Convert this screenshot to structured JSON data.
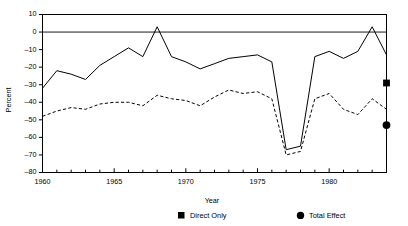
{
  "chart_data": {
    "type": "line",
    "title": "",
    "xlabel": "Year",
    "ylabel": "Percent",
    "xlim": [
      1960,
      1984
    ],
    "ylim": [
      -80,
      10
    ],
    "grid": false,
    "legend_position": "bottom",
    "y_ticks": [
      10,
      0,
      -10,
      -20,
      -30,
      -40,
      -50,
      -60,
      -70,
      -80
    ],
    "y_tick_labels": [
      "10",
      "0",
      "-10",
      "-20",
      "-30",
      "-40",
      "-50",
      "-60",
      "-70",
      "-80"
    ],
    "x_ticks": [
      1960,
      1961,
      1962,
      1963,
      1964,
      1965,
      1966,
      1967,
      1968,
      1969,
      1970,
      1971,
      1972,
      1973,
      1974,
      1975,
      1976,
      1977,
      1978,
      1979,
      1980,
      1981,
      1982,
      1983,
      1984
    ],
    "x_tick_labels_shown": [
      "1960",
      "1965",
      "1970",
      "1975",
      "1980"
    ],
    "x_labeled_ticks": [
      1960,
      1965,
      1970,
      1975,
      1980
    ],
    "reference_line_y": 0,
    "x": [
      1960,
      1961,
      1962,
      1963,
      1964,
      1965,
      1966,
      1967,
      1968,
      1969,
      1970,
      1971,
      1972,
      1973,
      1974,
      1975,
      1976,
      1977,
      1978,
      1979,
      1980,
      1981,
      1982,
      1983,
      1984
    ],
    "series": [
      {
        "name": "Direct Only",
        "style": "solid",
        "marker": "square",
        "values": [
          -32,
          -22,
          -24,
          -27,
          -19,
          -14,
          -9,
          -14,
          3,
          -14,
          -17,
          -21,
          -18,
          -15,
          -14,
          -13,
          -17,
          -22,
          -29,
          -40,
          -57,
          -65,
          -67,
          -63,
          -52
        ]
      },
      {
        "name": "Total Effect",
        "style": "dashed",
        "marker": "circle",
        "values": [
          -48,
          -45,
          -43,
          -44,
          -41,
          -40,
          -40,
          -42,
          -36,
          -38,
          -39,
          -42,
          -37,
          -33,
          -35,
          -34,
          -38,
          -38,
          -41,
          -46,
          -60,
          -68,
          -70,
          -70,
          -68
        ]
      }
    ],
    "series_tail": {
      "note": "continuation 1977-1984 for both series",
      "x": [
        1977,
        1978,
        1979,
        1980,
        1981,
        1982,
        1983,
        1984
      ],
      "direct_only": [
        -67,
        -65,
        -14,
        -11,
        -15,
        -11,
        3,
        -13
      ],
      "total_effect": [
        -70,
        -68,
        -38,
        -35,
        -44,
        -47,
        -38,
        -44
      ]
    },
    "end_markers": [
      {
        "series": "Direct Only",
        "shape": "square",
        "x": 1984,
        "y": -29
      },
      {
        "series": "Total Effect",
        "shape": "circle",
        "x": 1984,
        "y": -53
      }
    ]
  },
  "legend": {
    "items": [
      {
        "label": "Direct Only",
        "marker": "square"
      },
      {
        "label": "Total Effect",
        "marker": "circle"
      }
    ]
  },
  "axes": {
    "x_title": "Year",
    "y_title": "Percent"
  }
}
